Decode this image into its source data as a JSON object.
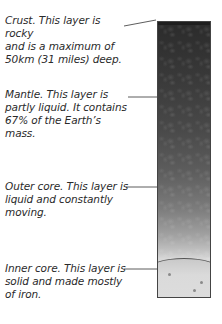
{
  "diagram": {
    "layers": [
      {
        "name": "crust",
        "text": "Crust. This layer is rocky and is a maximum of 50km (31 miles) deep.",
        "lines": [
          "Crust. This layer is rocky",
          "and is a maximum of",
          "50km (31 miles) deep."
        ]
      },
      {
        "name": "mantle",
        "text": "Mantle. This layer is partly liquid. It contains 67% of the Earth's mass.",
        "lines": [
          "Mantle. This layer is",
          "partly liquid. It contains",
          "67% of the Earth’s",
          "mass."
        ]
      },
      {
        "name": "outer-core",
        "text": "Outer core. This layer is liquid and constantly moving.",
        "lines": [
          "Outer core. This layer is",
          "liquid and constantly",
          "moving."
        ]
      },
      {
        "name": "inner-core",
        "text": "Inner core. This layer is solid and made mostly of iron.",
        "lines": [
          "Inner core. This layer is",
          "solid and made mostly",
          "of iron."
        ]
      }
    ],
    "colors": {
      "crust": "#1e1e1e",
      "mantle_top": "#2b2b2b",
      "outer_core": "#7c7c7c",
      "inner_core": "#d9d9d9",
      "text": "#2a2a2a",
      "leader_line": "#333333"
    }
  }
}
